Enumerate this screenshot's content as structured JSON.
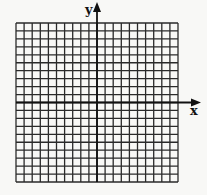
{
  "chart_data": {
    "type": "grid",
    "title": "",
    "xlabel": "x",
    "ylabel": "y",
    "grid": {
      "columns": 20,
      "rows": 20,
      "cell_size_px": 8.1,
      "origin_col": 10,
      "origin_row": 10
    },
    "x_ticks": [],
    "y_ticks": [],
    "colors": {
      "background": "#f8f8f6",
      "grid_line": "#2a2a2a",
      "axis": "#111111"
    }
  },
  "labels": {
    "x_axis": "x",
    "y_axis": "y"
  }
}
